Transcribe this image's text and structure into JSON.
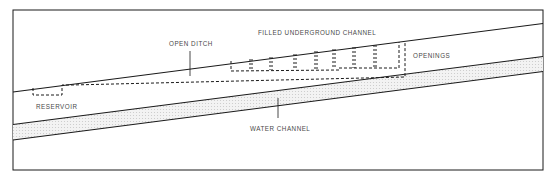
{
  "diagram": {
    "labels": {
      "open_ditch": "OPEN DITCH",
      "filled_underground_channel": "FILLED UNDERGROUND CHANNEL",
      "openings": "OPENINGS",
      "reservoir": "RESERVOIR",
      "water_channel": "WATER CHANNEL"
    },
    "colors": {
      "line": "#1a1a1a",
      "text": "#4a4a4a",
      "channel_fill": "#ececec"
    }
  }
}
